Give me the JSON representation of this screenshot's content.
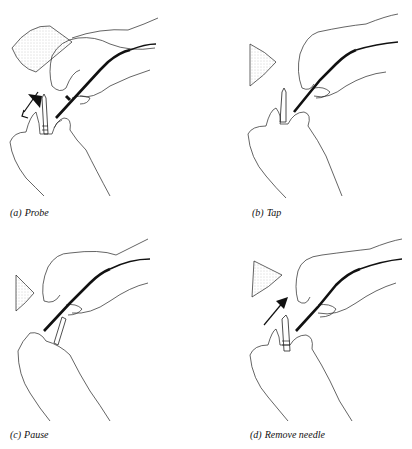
{
  "figure": {
    "panels": [
      {
        "label": "(a)",
        "title": "Probe",
        "arrow": "down-left"
      },
      {
        "label": "(b)",
        "title": "Tap",
        "arrow": "none"
      },
      {
        "label": "(c)",
        "title": "Pause",
        "arrow": "none"
      },
      {
        "label": "(d)",
        "title": "Remove needle",
        "arrow": "up-right"
      }
    ],
    "colors": {
      "ink": "#111111",
      "background": "#ffffff",
      "stipple": "#9a9a9a"
    }
  }
}
